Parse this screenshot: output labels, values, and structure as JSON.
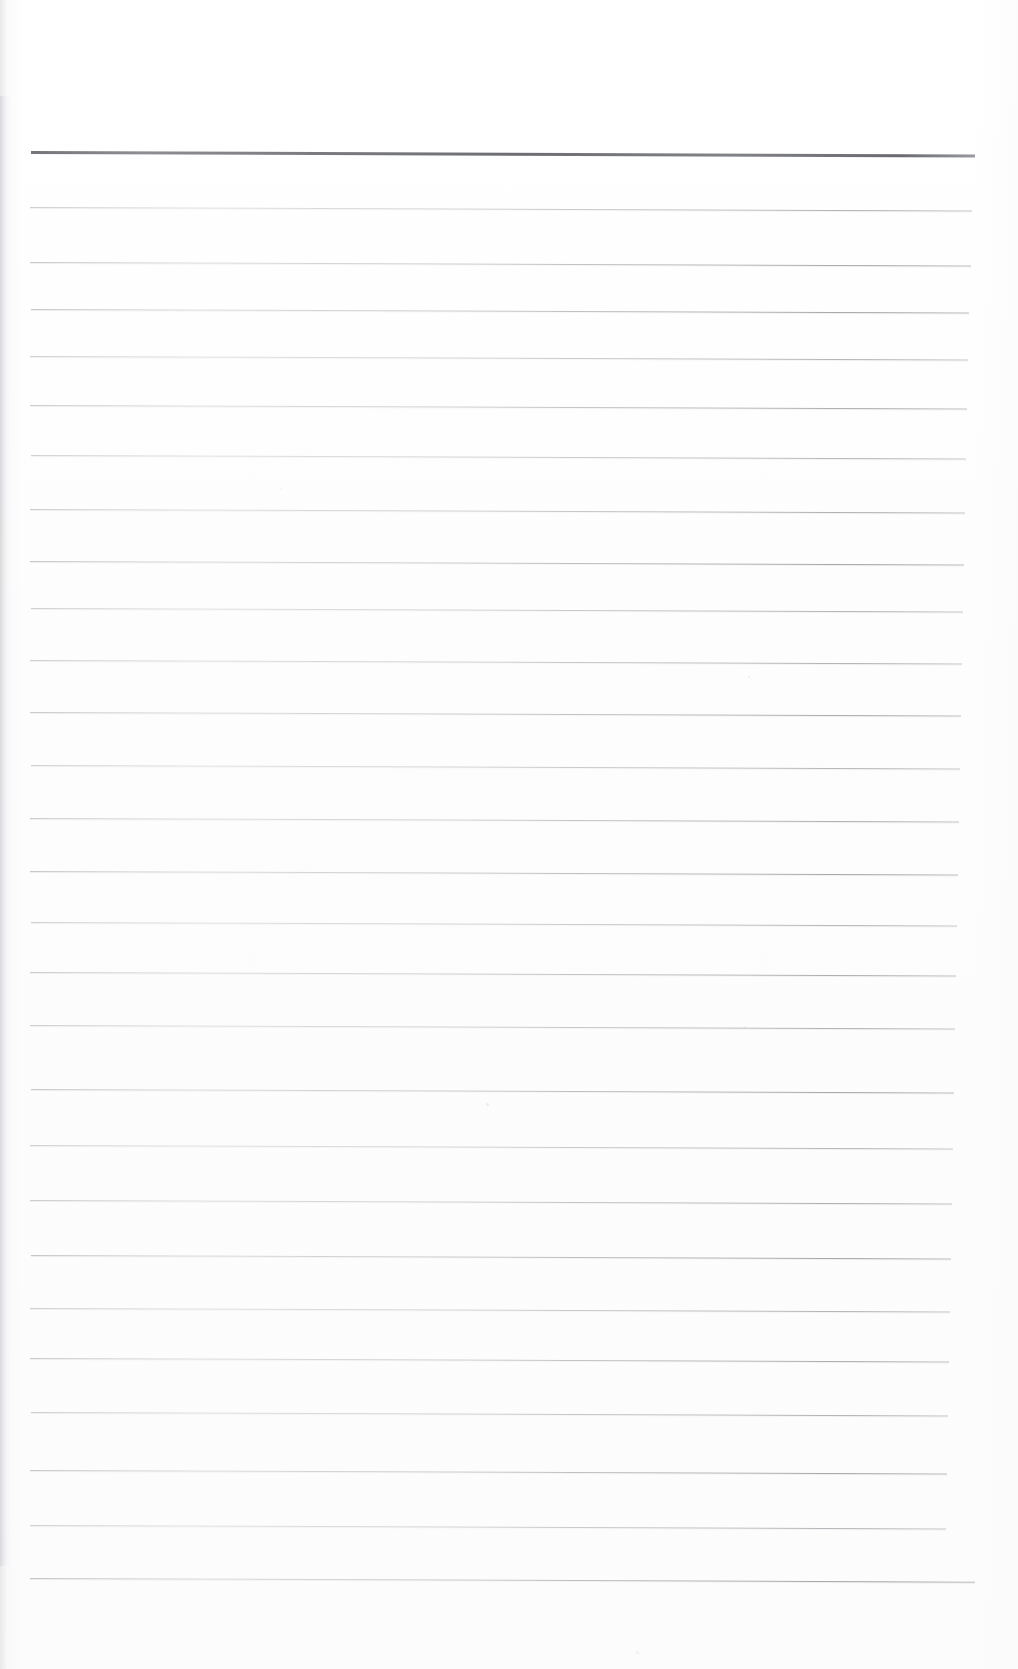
{
  "document": {
    "kind": "scanned-ruled-paper",
    "title": "Blank ruled notebook page",
    "page_width_px": 1018,
    "page_height_px": 1669,
    "background_color": "#ffffff",
    "paper_tint_color": "#fdfdfd",
    "text_content": "",
    "body_text": ""
  },
  "ruling": {
    "line_color": "#9a9ca1",
    "heavy_line_color": "#5f6166",
    "line_count": 27,
    "first_line_y": 152,
    "last_line_y": 1578,
    "line_spacing_px": 54.8,
    "left_margin_x": 31,
    "right_margin_x": 974,
    "line_tilt_deg": 0.22,
    "heavy_line_index": 0,
    "lines": [
      {
        "index": 0,
        "y": 152,
        "x1": 31,
        "x2": 975,
        "weight": "heavy",
        "opacity": 0.95
      },
      {
        "index": 1,
        "y": 207,
        "x1": 30,
        "x2": 972,
        "weight": "normal",
        "opacity": 0.62
      },
      {
        "index": 2,
        "y": 262,
        "x1": 30,
        "x2": 971,
        "weight": "normal",
        "opacity": 0.7
      },
      {
        "index": 3,
        "y": 309,
        "x1": 31,
        "x2": 969,
        "weight": "normal",
        "opacity": 0.72
      },
      {
        "index": 4,
        "y": 356,
        "x1": 30,
        "x2": 968,
        "weight": "normal",
        "opacity": 0.6
      },
      {
        "index": 5,
        "y": 405,
        "x1": 30,
        "x2": 967,
        "weight": "normal",
        "opacity": 0.66
      },
      {
        "index": 6,
        "y": 455,
        "x1": 31,
        "x2": 966,
        "weight": "normal",
        "opacity": 0.58
      },
      {
        "index": 7,
        "y": 509,
        "x1": 30,
        "x2": 965,
        "weight": "normal",
        "opacity": 0.64
      },
      {
        "index": 8,
        "y": 561,
        "x1": 30,
        "x2": 964,
        "weight": "normal",
        "opacity": 0.72
      },
      {
        "index": 9,
        "y": 608,
        "x1": 31,
        "x2": 963,
        "weight": "normal",
        "opacity": 0.6
      },
      {
        "index": 10,
        "y": 660,
        "x1": 30,
        "x2": 962,
        "weight": "normal",
        "opacity": 0.62
      },
      {
        "index": 11,
        "y": 712,
        "x1": 30,
        "x2": 961,
        "weight": "normal",
        "opacity": 0.68
      },
      {
        "index": 12,
        "y": 765,
        "x1": 31,
        "x2": 960,
        "weight": "normal",
        "opacity": 0.58
      },
      {
        "index": 13,
        "y": 818,
        "x1": 30,
        "x2": 959,
        "weight": "normal",
        "opacity": 0.64
      },
      {
        "index": 14,
        "y": 871,
        "x1": 30,
        "x2": 958,
        "weight": "normal",
        "opacity": 0.7
      },
      {
        "index": 15,
        "y": 922,
        "x1": 31,
        "x2": 957,
        "weight": "normal",
        "opacity": 0.58
      },
      {
        "index": 16,
        "y": 972,
        "x1": 30,
        "x2": 956,
        "weight": "normal",
        "opacity": 0.66
      },
      {
        "index": 17,
        "y": 1025,
        "x1": 30,
        "x2": 955,
        "weight": "normal",
        "opacity": 0.62
      },
      {
        "index": 18,
        "y": 1089,
        "x1": 31,
        "x2": 954,
        "weight": "normal",
        "opacity": 0.7
      },
      {
        "index": 19,
        "y": 1145,
        "x1": 30,
        "x2": 953,
        "weight": "normal",
        "opacity": 0.58
      },
      {
        "index": 20,
        "y": 1200,
        "x1": 30,
        "x2": 952,
        "weight": "normal",
        "opacity": 0.64
      },
      {
        "index": 21,
        "y": 1255,
        "x1": 31,
        "x2": 951,
        "weight": "normal",
        "opacity": 0.72
      },
      {
        "index": 22,
        "y": 1308,
        "x1": 30,
        "x2": 950,
        "weight": "normal",
        "opacity": 0.6
      },
      {
        "index": 23,
        "y": 1358,
        "x1": 30,
        "x2": 949,
        "weight": "normal",
        "opacity": 0.66
      },
      {
        "index": 24,
        "y": 1412,
        "x1": 31,
        "x2": 948,
        "weight": "normal",
        "opacity": 0.62
      },
      {
        "index": 25,
        "y": 1470,
        "x1": 30,
        "x2": 947,
        "weight": "normal",
        "opacity": 0.7
      },
      {
        "index": 26,
        "y": 1525,
        "x1": 30,
        "x2": 946,
        "weight": "normal",
        "opacity": 0.58
      },
      {
        "index": 27,
        "y": 1578,
        "x1": 30,
        "x2": 975,
        "weight": "normal",
        "opacity": 0.74
      }
    ]
  },
  "marks": [
    {
      "name": "scan-speck",
      "x": 486,
      "y": 1103,
      "size": 3,
      "opacity": 0.35
    },
    {
      "name": "scan-speck",
      "x": 748,
      "y": 676,
      "size": 2,
      "opacity": 0.3
    },
    {
      "name": "scan-speck",
      "x": 744,
      "y": 1026,
      "size": 2,
      "opacity": 0.28
    },
    {
      "name": "scan-speck",
      "x": 280,
      "y": 488,
      "size": 2,
      "opacity": 0.22
    },
    {
      "name": "scan-speck",
      "x": 636,
      "y": 1651,
      "size": 3,
      "opacity": 0.25
    }
  ]
}
